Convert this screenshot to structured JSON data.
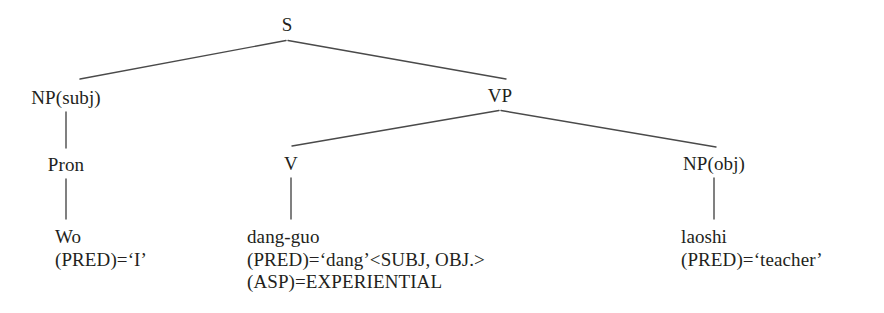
{
  "figure": {
    "kind": "syntax-tree",
    "ink_color": "#231f20",
    "line_color": "#4a4a4a",
    "background": "#ffffff"
  },
  "nodes": {
    "s": {
      "label": "S"
    },
    "np_subj": {
      "label": "NP(subj)"
    },
    "vp": {
      "label": "VP"
    },
    "pron": {
      "label": "Pron"
    },
    "v": {
      "label": "V"
    },
    "np_obj": {
      "label": "NP(obj)"
    }
  },
  "leaves": {
    "wo": {
      "word": "Wo",
      "lines": [
        "Wo",
        "(PRED)=‘I’"
      ]
    },
    "dangguo": {
      "word": "dang-guo",
      "lines": [
        "dang-guo",
        "(PRED)=‘dang’<SUBJ, OBJ.>",
        "(ASP)=EXPERIENTIAL"
      ]
    },
    "laoshi": {
      "word": "laoshi",
      "lines": [
        "laoshi",
        "(PRED)=‘teacher’"
      ]
    }
  }
}
